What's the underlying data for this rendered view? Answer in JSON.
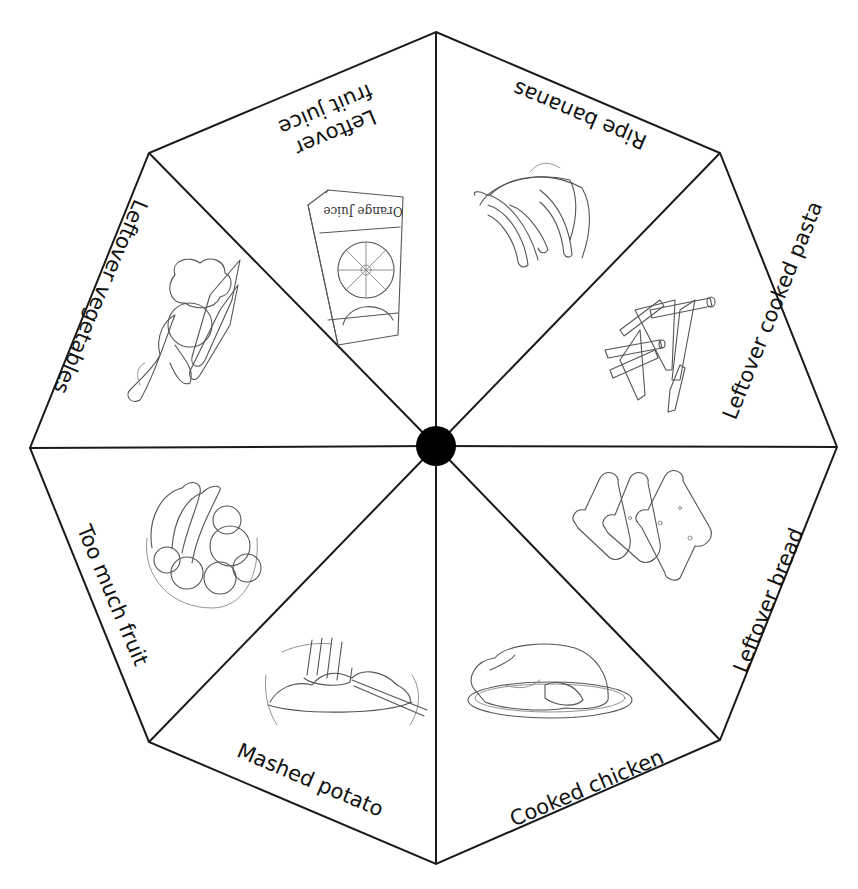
{
  "diagram": {
    "type": "octagonal spinner wheel",
    "center_hub": "black-dot",
    "segments": [
      {
        "id": "ripe-bananas",
        "label": "Ripe bananas",
        "illustration": "bunch-of-bananas"
      },
      {
        "id": "leftover-cooked-pasta",
        "label": "Leftover cooked pasta",
        "illustration": "penne-pasta"
      },
      {
        "id": "leftover-bread",
        "label": "Leftover bread",
        "illustration": "bread-slices"
      },
      {
        "id": "cooked-chicken",
        "label": "Cooked chicken",
        "illustration": "roast-chicken-on-plate"
      },
      {
        "id": "mashed-potato",
        "label": "Mashed potato",
        "illustration": "potato-masher-in-bowl"
      },
      {
        "id": "too-much-fruit",
        "label": "Too much fruit",
        "illustration": "fruit-bowl"
      },
      {
        "id": "leftover-vegetables",
        "label": "Leftover vegetables",
        "illustration": "vegetable-bundle"
      },
      {
        "id": "leftover-fruit-juice",
        "label_line1": "Leftover",
        "label_line2": "fruit juice",
        "illustration": "orange-juice-carton",
        "carton_text": "Orange Juice"
      }
    ]
  },
  "colors": {
    "line": "#1a1a1a",
    "hub": "#000000",
    "background": "#ffffff",
    "text": "#111111"
  }
}
